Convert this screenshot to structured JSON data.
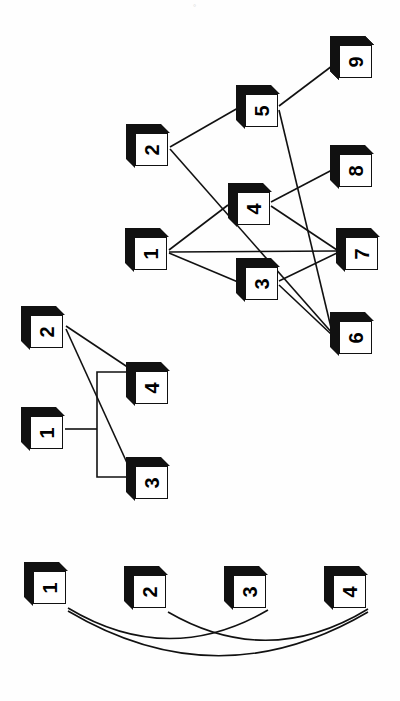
{
  "page": {
    "background_color": "#ffffff",
    "node_face_color": "#ffffff",
    "node_shadow_color": "#111111",
    "edge_color": "#111111",
    "orientation": "nodes rotated 90 degrees (labels read sideways)",
    "corner_mark": "°"
  },
  "figures": [
    {
      "id": "figure-top",
      "name": "nine-node-graph",
      "node_count": 9,
      "edge_count": 10,
      "nodes": [
        {
          "id": "1",
          "label": "1",
          "x": 125,
          "y": 228
        },
        {
          "id": "2",
          "label": "2",
          "x": 126,
          "y": 124
        },
        {
          "id": "3",
          "label": "3",
          "x": 236,
          "y": 258
        },
        {
          "id": "4",
          "label": "4",
          "x": 228,
          "y": 183
        },
        {
          "id": "5",
          "label": "5",
          "x": 236,
          "y": 85
        },
        {
          "id": "6",
          "label": "6",
          "x": 330,
          "y": 312
        },
        {
          "id": "7",
          "label": "7",
          "x": 336,
          "y": 228
        },
        {
          "id": "8",
          "label": "8",
          "x": 330,
          "y": 145
        },
        {
          "id": "9",
          "label": "9",
          "x": 330,
          "y": 36
        }
      ],
      "edges": [
        {
          "from": "1",
          "to": "4"
        },
        {
          "from": "1",
          "to": "7"
        },
        {
          "from": "1",
          "to": "3"
        },
        {
          "from": "2",
          "to": "5"
        },
        {
          "from": "2",
          "to": "6"
        },
        {
          "from": "5",
          "to": "9"
        },
        {
          "from": "5",
          "to": "6"
        },
        {
          "from": "4",
          "to": "8"
        },
        {
          "from": "4",
          "to": "7"
        },
        {
          "from": "3",
          "to": "7"
        },
        {
          "from": "3",
          "to": "6"
        }
      ]
    },
    {
      "id": "figure-middle",
      "name": "four-node-bracket-graph",
      "node_count": 4,
      "edge_count": 4,
      "edge_style": "orthogonal bracket from node 1, straight diagonals from node 2",
      "nodes": [
        {
          "id": "1",
          "label": "1",
          "x": 21,
          "y": 407
        },
        {
          "id": "2",
          "label": "2",
          "x": 21,
          "y": 306
        },
        {
          "id": "3",
          "label": "3",
          "x": 126,
          "y": 457
        },
        {
          "id": "4",
          "label": "4",
          "x": 126,
          "y": 362
        }
      ],
      "edges": [
        {
          "from": "1",
          "to": "4",
          "style": "orthogonal"
        },
        {
          "from": "1",
          "to": "3",
          "style": "orthogonal"
        },
        {
          "from": "2",
          "to": "4",
          "style": "straight"
        },
        {
          "from": "2",
          "to": "3",
          "style": "straight"
        }
      ]
    },
    {
      "id": "figure-bottom",
      "name": "four-node-curved-graph",
      "node_count": 4,
      "edge_count": 3,
      "edge_style": "curved arcs below the nodes",
      "nodes": [
        {
          "id": "1",
          "label": "1",
          "x": 24,
          "y": 562
        },
        {
          "id": "2",
          "label": "2",
          "x": 124,
          "y": 566
        },
        {
          "id": "3",
          "label": "3",
          "x": 224,
          "y": 566
        },
        {
          "id": "4",
          "label": "4",
          "x": 324,
          "y": 566
        }
      ],
      "edges": [
        {
          "from": "1",
          "to": "3",
          "style": "arc"
        },
        {
          "from": "1",
          "to": "4",
          "style": "arc"
        },
        {
          "from": "2",
          "to": "4",
          "style": "arc"
        }
      ]
    }
  ]
}
